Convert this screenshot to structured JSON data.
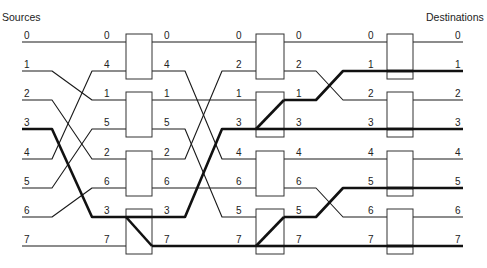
{
  "header": {
    "left_title": "Sources",
    "right_title": "Destinations"
  },
  "colors": {
    "line": "#1a1a1a",
    "box_border": "#333333",
    "background": "#ffffff"
  },
  "network": {
    "rows_y": [
      42,
      71,
      100,
      129,
      159,
      188,
      217,
      246
    ],
    "sources": [
      "0",
      "1",
      "2",
      "3",
      "4",
      "5",
      "6",
      "7"
    ],
    "stage1_inputs": [
      "0",
      "4",
      "1",
      "5",
      "2",
      "6",
      "3",
      "7"
    ],
    "stage1_outputs": [
      "0",
      "4",
      "1",
      "5",
      "2",
      "6",
      "3",
      "7"
    ],
    "stage2_inputs": [
      "0",
      "2",
      "1",
      "3",
      "4",
      "6",
      "5",
      "7"
    ],
    "stage2_outputs": [
      "0",
      "2",
      "1",
      "3",
      "4",
      "6",
      "5",
      "7"
    ],
    "stage3_inputs": [
      "0",
      "1",
      "2",
      "3",
      "4",
      "5",
      "6",
      "7"
    ],
    "destinations": [
      "0",
      "1",
      "2",
      "3",
      "4",
      "5",
      "6",
      "7"
    ],
    "stage_box_x": [
      [
        126,
        152
      ],
      [
        256,
        284
      ],
      [
        387,
        413
      ]
    ],
    "highlighted_destinations": [
      "1",
      "3",
      "5",
      "7"
    ],
    "highlighted_source": "3",
    "switch_settings": [
      [
        "straight",
        "straight",
        "straight",
        "lower-broadcast-upper-in"
      ],
      [
        "straight",
        "broadcast-from-lower",
        "straight",
        "broadcast-from-lower"
      ],
      [
        "straight",
        "straight",
        "straight",
        "straight"
      ]
    ]
  }
}
